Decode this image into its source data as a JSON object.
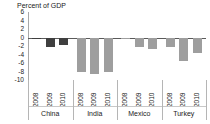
{
  "chart_data": {
    "type": "bar",
    "title": "Percent of GDP",
    "xlabel": "",
    "ylabel": "",
    "ylim": [
      -10,
      6
    ],
    "yticks": [
      "6",
      "4",
      "2",
      "0",
      "-2",
      "-4",
      "-6",
      "-8",
      "-10"
    ],
    "grid": false,
    "legend": "none",
    "categories": [
      "China",
      "India",
      "Mexico",
      "Turkey"
    ],
    "subcategories": [
      "2008",
      "2009",
      "2010"
    ],
    "groups": [
      {
        "name": "China",
        "color": "#3f3f3f",
        "bars": [
          {
            "year": "2008",
            "value": -0.4
          },
          {
            "year": "2009",
            "value": -2.2
          },
          {
            "year": "2010",
            "value": -1.7
          }
        ]
      },
      {
        "name": "India",
        "color": "#9e9e9e",
        "bars": [
          {
            "year": "2008",
            "value": -8.0
          },
          {
            "year": "2009",
            "value": -8.6
          },
          {
            "year": "2010",
            "value": -8.2
          }
        ]
      },
      {
        "name": "Mexico",
        "color": "#9e9e9e",
        "bars": [
          {
            "year": "2008",
            "value": -0.1
          },
          {
            "year": "2009",
            "value": -2.3
          },
          {
            "year": "2010",
            "value": -2.8
          }
        ]
      },
      {
        "name": "Turkey",
        "color": "#9e9e9e",
        "bars": [
          {
            "year": "2008",
            "value": -2.2
          },
          {
            "year": "2009",
            "value": -5.5
          },
          {
            "year": "2010",
            "value": -3.6
          }
        ]
      }
    ]
  }
}
